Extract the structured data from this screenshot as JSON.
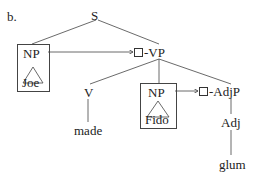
{
  "figure_label": "b.",
  "nodes": {
    "s": "S",
    "np_subject": {
      "label": "NP",
      "word": "Joe"
    },
    "vp": {
      "label": "-VP",
      "marker": "square"
    },
    "v": {
      "label": "V",
      "word": "made"
    },
    "np_object": {
      "label": "NP",
      "word": "Fido"
    },
    "adjp": {
      "label": "-AdjP",
      "marker": "square"
    },
    "adj": {
      "label": "Adj",
      "word": "glum"
    }
  },
  "colors": {
    "line": "#444444",
    "text": "#222222"
  }
}
